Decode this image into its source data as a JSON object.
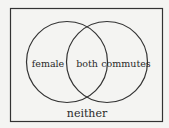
{
  "diagram": {
    "type": "venn",
    "sets": [
      {
        "id": "female",
        "label": "female"
      },
      {
        "id": "commutes",
        "label": "commutes"
      }
    ],
    "regions": {
      "left_only": "female",
      "intersection": "both",
      "right_only": "commutes",
      "outside": "neither"
    },
    "colors": {
      "stroke": "#333333",
      "background": "#f4f4f2",
      "text": "#2a2a2a"
    }
  }
}
